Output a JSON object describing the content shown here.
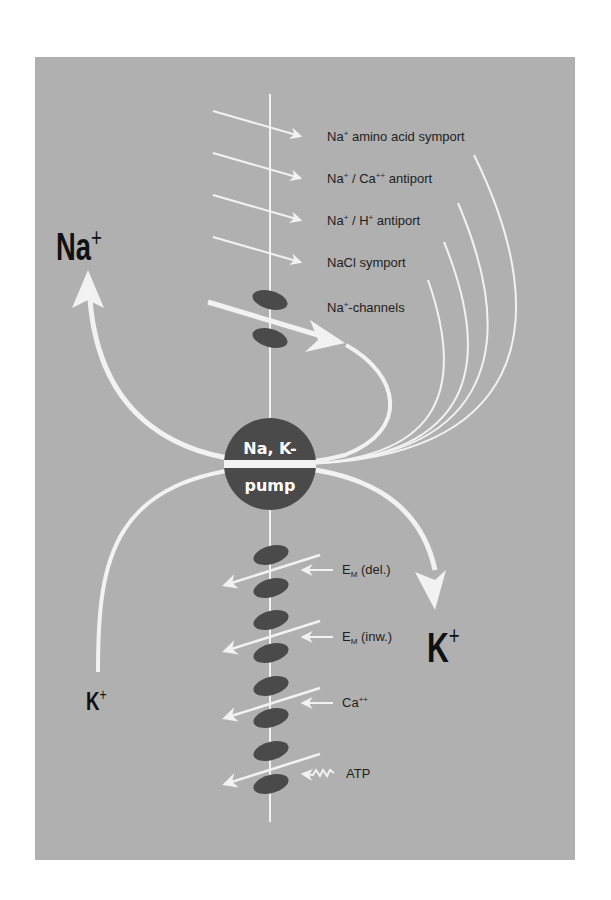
{
  "colors": {
    "background": "#ffffff",
    "panel": "#b0b0b0",
    "arrows": "#f2f2f2",
    "channels": "#4a4a4a",
    "pump": "#4a4a4a",
    "text": "#1e1e1e"
  },
  "ions": {
    "na_top": {
      "symbol": "Na",
      "charge": "+"
    },
    "k_right": {
      "symbol": "K",
      "charge": "+"
    },
    "k_left": {
      "symbol": "K",
      "charge": "+"
    }
  },
  "pump": {
    "line1": "Na, K-",
    "line2": "pump"
  },
  "transporters": [
    {
      "prefix": "Na",
      "sup": "+",
      "rest": " amino acid symport"
    },
    {
      "prefix": "Na",
      "sup": "+",
      "rest": " / Ca",
      "sup2": "++",
      "rest2": " antiport"
    },
    {
      "prefix": "Na",
      "sup": "+",
      "rest": " / H",
      "sup2": "+",
      "rest2": " antiport"
    },
    {
      "prefix": "NaCl symport"
    },
    {
      "prefix": "Na",
      "sup": "+",
      "rest": "-channels"
    }
  ],
  "k_channel_regulators": [
    {
      "main": "E",
      "sub": "M",
      "rest": " (del.)"
    },
    {
      "main": "E",
      "sub": "M",
      "rest": " (inw.)"
    },
    {
      "main": "Ca",
      "sup": "++"
    },
    {
      "main": "ATP"
    }
  ]
}
